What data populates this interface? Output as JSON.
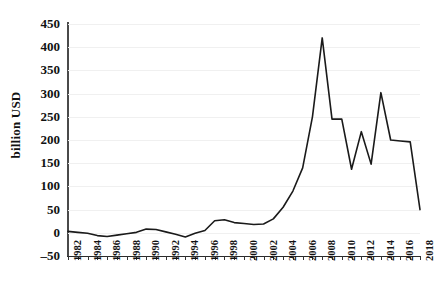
{
  "chart_data": {
    "type": "line",
    "title": "",
    "xlabel": "",
    "ylabel": "billion USD",
    "ylim": [
      -50,
      450
    ],
    "ytick_step": 50,
    "yticks": [
      450,
      400,
      350,
      300,
      250,
      200,
      150,
      100,
      50,
      0,
      -50
    ],
    "xlim": [
      1982,
      2018
    ],
    "xticks": [
      1982,
      1984,
      1986,
      1988,
      1990,
      1992,
      1994,
      1996,
      1998,
      2000,
      2002,
      2004,
      2006,
      2008,
      2010,
      2012,
      2014,
      2016,
      2018
    ],
    "grid": "horizontal-faint",
    "legend": "none",
    "line_color": "#1a1a1a",
    "x": [
      1982,
      1983,
      1984,
      1985,
      1986,
      1987,
      1988,
      1989,
      1990,
      1991,
      1992,
      1993,
      1994,
      1995,
      1996,
      1997,
      1998,
      1999,
      2000,
      2001,
      2002,
      2003,
      2004,
      2005,
      2006,
      2007,
      2008,
      2009,
      2010,
      2011,
      2012,
      2013,
      2014,
      2015,
      2016,
      2017,
      2018
    ],
    "values": [
      3,
      1,
      -1,
      -6,
      -8,
      -5,
      -2,
      1,
      8,
      7,
      2,
      -3,
      -9,
      -1,
      5,
      26,
      28,
      22,
      20,
      18,
      19,
      30,
      55,
      90,
      140,
      250,
      420,
      245,
      245,
      137,
      218,
      148,
      302,
      200,
      198,
      196,
      50
    ],
    "series": [
      {
        "name": "billion USD",
        "values": [
          3,
          1,
          -1,
          -6,
          -8,
          -5,
          -2,
          1,
          8,
          7,
          2,
          -3,
          -9,
          -1,
          5,
          26,
          28,
          22,
          20,
          18,
          19,
          30,
          55,
          90,
          140,
          250,
          420,
          245,
          245,
          137,
          218,
          148,
          302,
          200,
          198,
          196,
          50
        ]
      }
    ]
  }
}
